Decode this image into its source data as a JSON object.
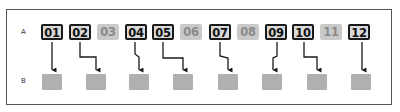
{
  "diagram": {
    "row_labels": {
      "a": "A",
      "b": "B"
    },
    "a_items": [
      {
        "label": "01",
        "state": "active",
        "x": 41
      },
      {
        "label": "02",
        "state": "active",
        "x": 69
      },
      {
        "label": "03",
        "state": "inactive",
        "x": 97
      },
      {
        "label": "04",
        "state": "active",
        "x": 125
      },
      {
        "label": "05",
        "state": "active",
        "x": 152
      },
      {
        "label": "06",
        "state": "inactive",
        "x": 180
      },
      {
        "label": "07",
        "state": "active",
        "x": 209
      },
      {
        "label": "08",
        "state": "inactive",
        "x": 237
      },
      {
        "label": "09",
        "state": "active",
        "x": 265
      },
      {
        "label": "10",
        "state": "active",
        "x": 292
      },
      {
        "label": "11",
        "state": "inactive",
        "x": 320
      },
      {
        "label": "12",
        "state": "active",
        "x": 348
      }
    ],
    "b_items": [
      {
        "index": 1,
        "x": 42
      },
      {
        "index": 2,
        "x": 86
      },
      {
        "index": 3,
        "x": 129
      },
      {
        "index": 4,
        "x": 173
      },
      {
        "index": 5,
        "x": 218
      },
      {
        "index": 6,
        "x": 262
      },
      {
        "index": 7,
        "x": 307
      },
      {
        "index": 8,
        "x": 351
      }
    ],
    "mappings": [
      {
        "from": "01",
        "to_b": 1
      },
      {
        "from": "02",
        "to_b": 2
      },
      {
        "from": "04",
        "to_b": 3
      },
      {
        "from": "05",
        "to_b": 4
      },
      {
        "from": "07",
        "to_b": 5
      },
      {
        "from": "09",
        "to_b": 6
      },
      {
        "from": "10",
        "to_b": 7
      },
      {
        "from": "12",
        "to_b": 8
      }
    ],
    "colors": {
      "active_border": "#1a1a1a",
      "active_fill": "#d9d9d9",
      "inactive_fill": "#c9c9c9",
      "inactive_text": "#8a8a8a",
      "b_fill": "#b0b0b0",
      "arrow": "#1a1a1a"
    }
  }
}
